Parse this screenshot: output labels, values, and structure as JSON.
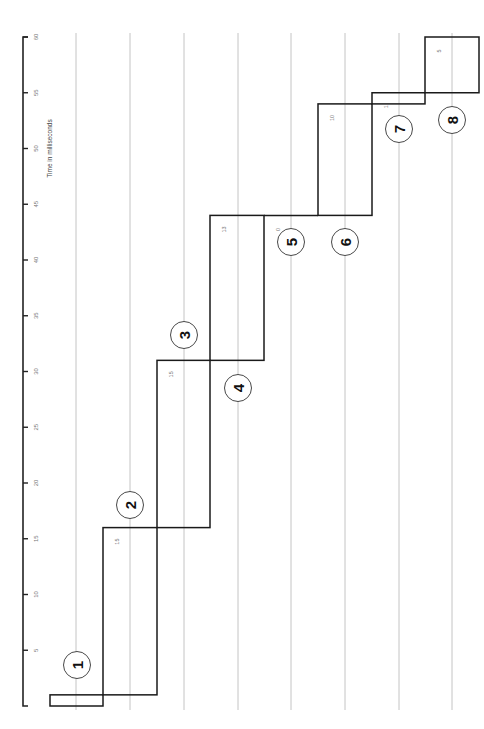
{
  "chart_data": {
    "type": "bar",
    "subtype": "step / cumulative timing chart (rotated 90°)",
    "title": "",
    "axis_label": "Time in milliseconds",
    "axis_ticks": [
      5,
      10,
      15,
      20,
      25,
      30,
      35,
      40,
      45,
      50,
      55,
      60
    ],
    "axis_range": [
      0,
      60
    ],
    "grid": true,
    "categories": [
      "1",
      "2",
      "3",
      "4",
      "5",
      "6",
      "7",
      "8"
    ],
    "steps": [
      {
        "marker": "1",
        "start": 0,
        "end": 1,
        "duration": null
      },
      {
        "marker": "2",
        "start": 1,
        "end": 16,
        "duration": 15
      },
      {
        "marker": "3",
        "start": 16,
        "end": 31,
        "duration": 15
      },
      {
        "marker": "4",
        "start": 31,
        "end": 44,
        "duration": 13
      },
      {
        "marker": "5",
        "start": 44,
        "end": 44,
        "duration": 0
      },
      {
        "marker": "6",
        "start": 44,
        "end": 54,
        "duration": 10
      },
      {
        "marker": "7",
        "start": 54,
        "end": 55,
        "duration": 1
      },
      {
        "marker": "8",
        "start": 55,
        "end": 60,
        "duration": 5
      }
    ],
    "duration_labels": [
      "15",
      "15",
      "13",
      "0",
      "10",
      "1",
      "5"
    ]
  }
}
